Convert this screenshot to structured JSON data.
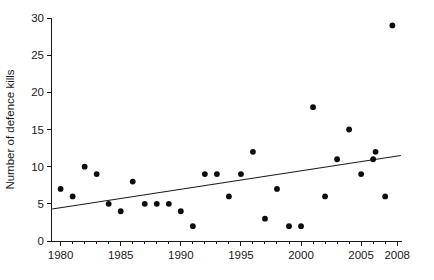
{
  "chart_data": {
    "type": "scatter",
    "title": "",
    "xlabel": "",
    "ylabel": "Number of defence kills",
    "xlim": [
      1979.2,
      2008.4
    ],
    "ylim": [
      0,
      30
    ],
    "grid": false,
    "legend": "none",
    "x_ticks_labeled": [
      1980,
      1985,
      1990,
      1995,
      2000,
      2005,
      2008
    ],
    "x_tick_labels": [
      "1980",
      "1985",
      "1990",
      "1995",
      "2000",
      "2005",
      "2008"
    ],
    "x_minor_tick_step": 1,
    "y_ticks": [
      0,
      5,
      10,
      15,
      20,
      25,
      30
    ],
    "y_tick_labels": [
      "0",
      "5",
      "10",
      "15",
      "20",
      "25",
      "30"
    ],
    "series": [
      {
        "name": "Number of defence kills",
        "marker": "filled-circle",
        "color": "#0d0d0d",
        "points": [
          {
            "x": 1980,
            "y": 7
          },
          {
            "x": 1981,
            "y": 6
          },
          {
            "x": 1982,
            "y": 10
          },
          {
            "x": 1983,
            "y": 9
          },
          {
            "x": 1984,
            "y": 5
          },
          {
            "x": 1985,
            "y": 4
          },
          {
            "x": 1986,
            "y": 8
          },
          {
            "x": 1987,
            "y": 5
          },
          {
            "x": 1988,
            "y": 5
          },
          {
            "x": 1989,
            "y": 5
          },
          {
            "x": 1990,
            "y": 4
          },
          {
            "x": 1991,
            "y": 2
          },
          {
            "x": 1992,
            "y": 9
          },
          {
            "x": 1993,
            "y": 9
          },
          {
            "x": 1994,
            "y": 6
          },
          {
            "x": 1995,
            "y": 9
          },
          {
            "x": 1996,
            "y": 12
          },
          {
            "x": 1997,
            "y": 3
          },
          {
            "x": 1998,
            "y": 7
          },
          {
            "x": 1999,
            "y": 2
          },
          {
            "x": 2000,
            "y": 2
          },
          {
            "x": 2001,
            "y": 18
          },
          {
            "x": 2002,
            "y": 6
          },
          {
            "x": 2003,
            "y": 11
          },
          {
            "x": 2004,
            "y": 15
          },
          {
            "x": 2005,
            "y": 9
          },
          {
            "x": 2006,
            "y": 11
          },
          {
            "x": 2006.2,
            "y": 12
          },
          {
            "x": 2007,
            "y": 6
          },
          {
            "x": 2007.6,
            "y": 29
          }
        ]
      }
    ],
    "trend_line": {
      "name": "linear-regression",
      "color": "#1a1a1a",
      "x_start": 1979.3,
      "y_start": 4.3,
      "x_end": 2008.3,
      "y_end": 11.5
    }
  }
}
